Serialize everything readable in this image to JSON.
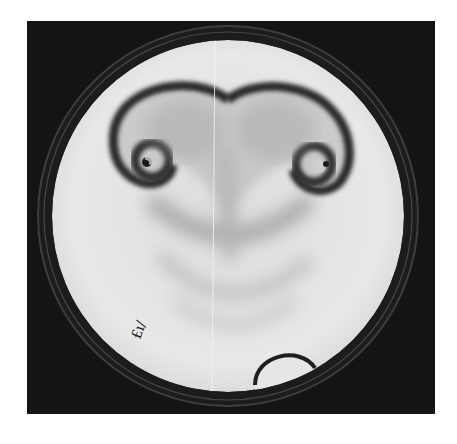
{
  "image": {
    "subject": "Petri dish with spiral chemical wave pattern",
    "description": "Black-and-white photograph of a circular dish showing two counter-rotating spiral waves joined in a heart-like front, with fainter concentric wave bands below and a small air bubble near the bottom rim",
    "handwritten_label": "£ı/",
    "colors": {
      "background": "#ffffff",
      "frame": "#141414",
      "dish_interior": "#e4e4e4",
      "wave_dark": "#2a2a2a",
      "wave_faint": "#9a9a9a"
    }
  }
}
